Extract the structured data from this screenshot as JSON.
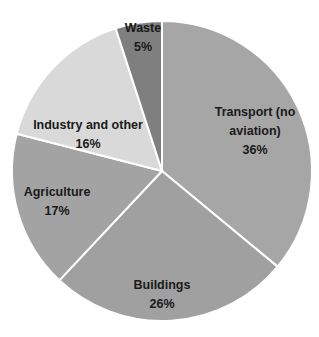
{
  "chart_data": {
    "type": "pie",
    "title": "",
    "start_angle_deg": 0,
    "direction": "clockwise",
    "categories": [
      "Transport (no aviation)",
      "Buildings",
      "Agriculture",
      "Industry and other",
      "Waste"
    ],
    "values": [
      36,
      26,
      17,
      16,
      5
    ],
    "unit": "%",
    "labels": [
      {
        "lines": [
          "Transport (no",
          "aviation)",
          "36%"
        ]
      },
      {
        "lines": [
          "Buildings",
          "26%"
        ]
      },
      {
        "lines": [
          "Agriculture",
          "17%"
        ]
      },
      {
        "lines": [
          "Industry and other",
          "16%"
        ]
      },
      {
        "lines": [
          "Waste",
          "5%"
        ]
      }
    ],
    "colors": [
      "#a6a6a6",
      "#a0a0a0",
      "#a3a3a3",
      "#d9d9d9",
      "#7f7f7f"
    ],
    "legend": "none",
    "data_labels": "inside"
  }
}
